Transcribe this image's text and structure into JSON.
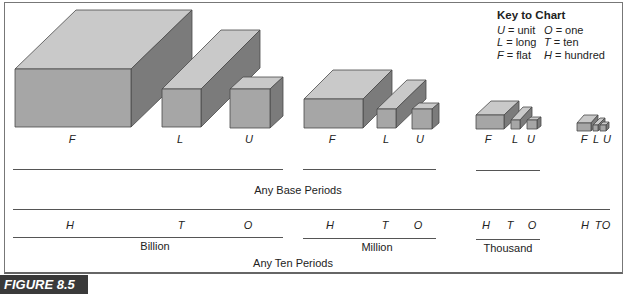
{
  "key": {
    "title": "Key to Chart",
    "entries": [
      {
        "sym": "U",
        "meaning": "= unit",
        "sym2": "O",
        "meaning2": "= one"
      },
      {
        "sym": "L",
        "meaning": "= long",
        "sym2": "T",
        "meaning2": "= ten"
      },
      {
        "sym": "F",
        "meaning": "= flat",
        "sym2": "H",
        "meaning2": "= hundred"
      }
    ]
  },
  "groups": [
    {
      "name": "Billion",
      "blocks": [
        "F",
        "L",
        "U"
      ],
      "places": [
        "H",
        "T",
        "O"
      ]
    },
    {
      "name": "Million",
      "blocks": [
        "F",
        "L",
        "U"
      ],
      "places": [
        "H",
        "T",
        "O"
      ]
    },
    {
      "name": "Thousand",
      "blocks": [
        "F",
        "L",
        "U"
      ],
      "places": [
        "H",
        "T",
        "O"
      ]
    },
    {
      "name": "",
      "blocks": [
        "F",
        "L",
        "U"
      ],
      "places": [
        "H",
        "T",
        "O"
      ]
    }
  ],
  "base_periods_label": "Any Base Periods",
  "ten_periods_label": "Any Ten Periods",
  "figure_label": "FIGURE 8.5",
  "colors": {
    "top": "#c9c9c9",
    "front": "#a6a6a6",
    "side": "#7b7b7b",
    "edge": "#4a4a4a"
  }
}
